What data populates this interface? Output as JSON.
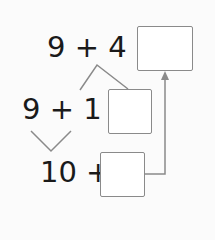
{
  "rows": [
    {
      "expression": "9 + 4 =",
      "answer": ""
    },
    {
      "expression": "9 + 1 +",
      "answer": ""
    },
    {
      "expression": "10 +",
      "answer": ""
    }
  ],
  "colors": {
    "line": "#8a8a8a",
    "text": "#1a1a1a"
  }
}
